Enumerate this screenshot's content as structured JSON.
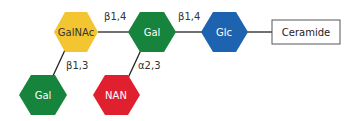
{
  "diagram": {
    "nodes": [
      {
        "id": "galnac",
        "label": "GalNAc",
        "color": "#f2c531",
        "text_color": "#333333"
      },
      {
        "id": "gal_top",
        "label": "Gal",
        "color": "#16843c",
        "text_color": "#ffffff"
      },
      {
        "id": "glc",
        "label": "Glc",
        "color": "#1e63b0",
        "text_color": "#ffffff"
      },
      {
        "id": "ceramide",
        "label": "Ceramide",
        "shape": "rectangle"
      },
      {
        "id": "gal_bottom",
        "label": "Gal",
        "color": "#16843c",
        "text_color": "#ffffff"
      },
      {
        "id": "nan",
        "label": "NAN",
        "color": "#e0202e",
        "text_color": "#ffffff"
      }
    ],
    "links": [
      {
        "from": "galnac",
        "to": "gal_top",
        "label": "β1,4"
      },
      {
        "from": "gal_top",
        "to": "glc",
        "label": "β1,4"
      },
      {
        "from": "glc",
        "to": "ceramide",
        "label": ""
      },
      {
        "from": "gal_bottom",
        "to": "galnac",
        "label": "β1,3"
      },
      {
        "from": "nan",
        "to": "gal_top",
        "label": "α2,3"
      }
    ]
  }
}
